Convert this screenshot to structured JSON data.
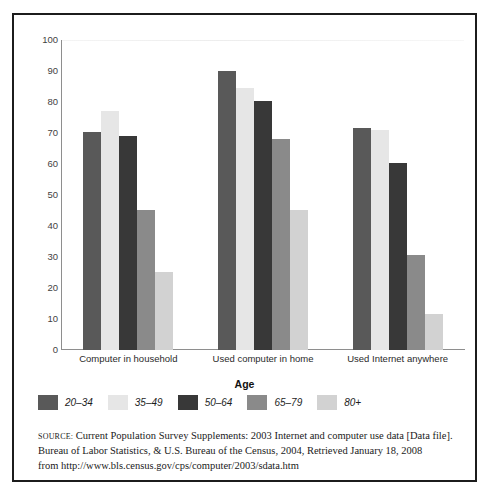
{
  "chart_data": {
    "type": "bar",
    "title": "",
    "subtitle": "",
    "xlabel": "Age",
    "ylabel": "% Yes",
    "ylim": [
      0,
      100
    ],
    "ytick_step": 10,
    "yticks": [
      "100",
      "90",
      "80",
      "70",
      "60",
      "50",
      "40",
      "30",
      "20",
      "10",
      "0"
    ],
    "grid": "top-gridline-only",
    "legend_position": "below-plot-left",
    "categories": [
      "Computer in household",
      "Used computer in home",
      "Used Internet anywhere"
    ],
    "series": [
      {
        "name": "20–34",
        "color": "#595959",
        "values": [
          70.3,
          90.0,
          71.5
        ]
      },
      {
        "name": "35–49",
        "color": "#e6e6e6",
        "values": [
          77.0,
          84.5,
          71.0
        ]
      },
      {
        "name": "50–64",
        "color": "#383838",
        "values": [
          69.0,
          80.3,
          60.3
        ]
      },
      {
        "name": "65–79",
        "color": "#8a8a8a",
        "values": [
          45.3,
          68.0,
          30.8
        ]
      },
      {
        "name": "80+",
        "color": "#d2d2d2",
        "values": [
          25.2,
          45.3,
          11.5
        ]
      }
    ]
  },
  "source": {
    "label": "Source:",
    "lines": [
      "Current Population Survey Supplements: 2003 Internet and computer use data [Data file].",
      "Bureau of Labor Statistics, & U.S. Bureau of the Census, 2004, Retrieved January 18, 2008",
      "from http://www.bls.census.gov/cps/computer/2003/sdata.htm"
    ]
  },
  "colors": {
    "border": "#1c1c1c",
    "axis": "#8e8e8e",
    "text": "#1a1a1a",
    "background": "#ffffff"
  }
}
